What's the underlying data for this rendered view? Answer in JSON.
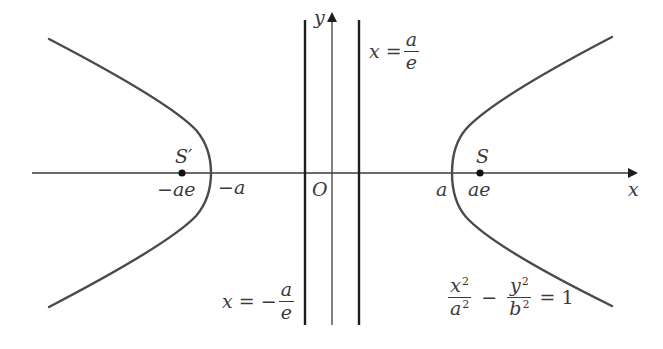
{
  "diagram": {
    "colors": {
      "curve": "#4a4a4a",
      "axis": "#3a3a3a",
      "directrix": "#1e1e1e",
      "text": "#3a3a3a",
      "background": "#ffffff"
    },
    "axes": {
      "x_label": "x",
      "y_label": "y",
      "origin_label": "O"
    },
    "foci": {
      "left_label": "S′",
      "right_label": "S",
      "left_coord_label": "−ae",
      "right_coord_label": "ae"
    },
    "vertices": {
      "left_label": "−a",
      "right_label": "a"
    },
    "directrices": {
      "right": {
        "lhs": "x =",
        "num": "a",
        "den": "e"
      },
      "left": {
        "lhs": "x = −",
        "num": "a",
        "den": "e"
      }
    },
    "equation": {
      "term1_num": "x",
      "term1_num_exp": "2",
      "term1_den": "a",
      "term1_den_exp": "2",
      "minus": "−",
      "term2_num": "y",
      "term2_num_exp": "2",
      "term2_den": "b",
      "term2_den_exp": "2",
      "rhs": "= 1"
    }
  }
}
